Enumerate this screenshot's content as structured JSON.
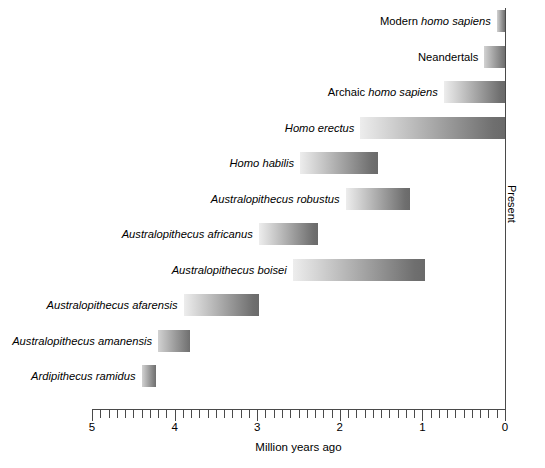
{
  "chart_data": {
    "type": "bar",
    "orientation": "horizontal-range",
    "title": "",
    "xlabel": "Million years ago",
    "ylabel": "",
    "right_axis_label": "Present",
    "xlim": [
      5,
      0
    ],
    "x_tick_labels": [
      "5",
      "4",
      "3",
      "2",
      "1",
      "0"
    ],
    "x_major_ticks": [
      5,
      4,
      3,
      2,
      1,
      0
    ],
    "x_minor_tick_step": 0.1,
    "grid": false,
    "legend": null,
    "axis_direction": "right-to-left (5 Mya at left, 0 = present at right)",
    "categories": [
      "Modern homo sapiens",
      "Neandertals",
      "Archaic homo sapiens",
      "Homo erectus",
      "Homo habilis",
      "Australopithecus robustus",
      "Australopithecus africanus",
      "Australopithecus boisei",
      "Australopithecus afarensis",
      "Australopithecus amanensis",
      "Ardipithecus ramidus"
    ],
    "ranges": [
      {
        "label": "Modern homo sapiens",
        "label_roman": "Modern",
        "label_italic": "homo sapiens",
        "start_mya": 0.1,
        "end_mya": 0.0
      },
      {
        "label": "Neandertals",
        "label_roman": "Neandertals",
        "label_italic": "",
        "start_mya": 0.25,
        "end_mya": 0.0
      },
      {
        "label": "Archaic homo sapiens",
        "label_roman": "Archaic",
        "label_italic": "homo sapiens",
        "start_mya": 0.74,
        "end_mya": 0.0
      },
      {
        "label": "Homo erectus",
        "label_roman": "",
        "label_italic": "Homo erectus",
        "start_mya": 1.75,
        "end_mya": 0.0
      },
      {
        "label": "Homo habilis",
        "label_roman": "",
        "label_italic": "Homo habilis",
        "start_mya": 2.48,
        "end_mya": 1.54
      },
      {
        "label": "Australopithecus robustus",
        "label_roman": "",
        "label_italic": "Australopithecus robustus",
        "start_mya": 1.93,
        "end_mya": 1.15
      },
      {
        "label": "Australopithecus africanus",
        "label_roman": "",
        "label_italic": "Australopithecus africanus",
        "start_mya": 2.98,
        "end_mya": 2.26
      },
      {
        "label": "Australopithecus boisei",
        "label_roman": "",
        "label_italic": "Australopithecus boisei",
        "start_mya": 2.57,
        "end_mya": 0.97
      },
      {
        "label": "Australopithecus afarensis",
        "label_roman": "",
        "label_italic": "Australopithecus afarensis",
        "start_mya": 3.89,
        "end_mya": 2.98
      },
      {
        "label": "Australopithecus amanensis",
        "label_roman": "",
        "label_italic": "Australopithecus amanensis",
        "start_mya": 4.2,
        "end_mya": 3.81
      },
      {
        "label": "Ardipithecus ramidus",
        "label_roman": "",
        "label_italic": "Ardipithecus ramidus",
        "start_mya": 4.4,
        "end_mya": 4.22
      }
    ],
    "bar_fill": {
      "light": "#ededed",
      "dark": "#6a6a6a",
      "direction": "left-to-right"
    },
    "axis_color": "#4a4a4a"
  }
}
